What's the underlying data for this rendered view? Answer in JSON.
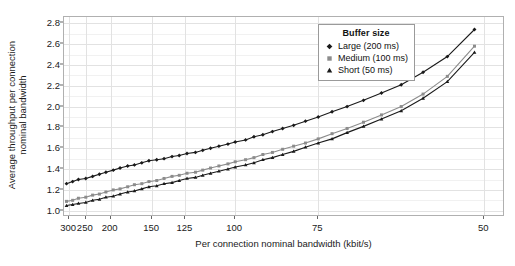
{
  "chart_data": {
    "type": "line",
    "title": "",
    "xlabel": "Per connection nominal bandwidth (kbit/s)",
    "ylabel": "Average throughput per connection\nnominal bandwidth",
    "ylabel_line1": "Average throughput per connection",
    "ylabel_line2": "nominal bandwidth",
    "x_scale": "reciprocal",
    "x_tick_labels": [
      "300",
      "250",
      "200",
      "150",
      "125",
      "100",
      "75",
      "50"
    ],
    "x_ticks": [
      300,
      250,
      200,
      150,
      125,
      100,
      75,
      50
    ],
    "xlim": [
      320,
      48
    ],
    "y_tick_labels": [
      "1.0",
      "1.2",
      "1.4",
      "1.6",
      "1.8",
      "2.0",
      "2.2",
      "2.4",
      "2.6",
      "2.8"
    ],
    "y_ticks": [
      1.0,
      1.2,
      1.4,
      1.6,
      1.8,
      2.0,
      2.2,
      2.4,
      2.6,
      2.8
    ],
    "ylim": [
      0.94,
      2.86
    ],
    "grid": true,
    "legend_position": "top-right",
    "legend_title": "Buffer size",
    "x": [
      310,
      288,
      270,
      250,
      234,
      220,
      208,
      196,
      186,
      176,
      168,
      160,
      153,
      146,
      140,
      134,
      129,
      124,
      119,
      115,
      111,
      107,
      103,
      100,
      96,
      93,
      90,
      87,
      84,
      81,
      78,
      75,
      72,
      69,
      66,
      63,
      60,
      57,
      54,
      51
    ],
    "series": [
      {
        "name": "Large (200 ms)",
        "marker": "diamond",
        "color": "#1a1a1a",
        "values": [
          1.26,
          1.28,
          1.3,
          1.31,
          1.33,
          1.35,
          1.37,
          1.39,
          1.41,
          1.43,
          1.44,
          1.46,
          1.48,
          1.49,
          1.5,
          1.52,
          1.53,
          1.55,
          1.56,
          1.58,
          1.6,
          1.62,
          1.64,
          1.66,
          1.68,
          1.71,
          1.73,
          1.76,
          1.79,
          1.82,
          1.86,
          1.9,
          1.95,
          2.0,
          2.06,
          2.13,
          2.21,
          2.33,
          2.48,
          2.74
        ]
      },
      {
        "name": "Medium (100 ms)",
        "marker": "square",
        "color": "#8c8c8c",
        "values": [
          1.09,
          1.1,
          1.12,
          1.13,
          1.15,
          1.16,
          1.18,
          1.2,
          1.21,
          1.23,
          1.25,
          1.26,
          1.28,
          1.29,
          1.31,
          1.33,
          1.34,
          1.36,
          1.37,
          1.39,
          1.41,
          1.43,
          1.45,
          1.47,
          1.49,
          1.51,
          1.54,
          1.56,
          1.59,
          1.62,
          1.65,
          1.69,
          1.74,
          1.79,
          1.85,
          1.92,
          2.0,
          2.12,
          2.29,
          2.58
        ]
      },
      {
        "name": "Short (50 ms)",
        "marker": "triangle",
        "color": "#1a1a1a",
        "values": [
          1.05,
          1.06,
          1.07,
          1.08,
          1.1,
          1.11,
          1.13,
          1.14,
          1.16,
          1.18,
          1.19,
          1.21,
          1.23,
          1.24,
          1.26,
          1.27,
          1.29,
          1.31,
          1.32,
          1.34,
          1.36,
          1.38,
          1.4,
          1.42,
          1.44,
          1.46,
          1.49,
          1.51,
          1.54,
          1.57,
          1.61,
          1.65,
          1.69,
          1.75,
          1.81,
          1.88,
          1.96,
          2.08,
          2.24,
          2.52
        ]
      }
    ]
  },
  "legend": {
    "title": "Buffer size",
    "items": [
      {
        "label": "Large (200 ms)"
      },
      {
        "label": "Medium (100 ms)"
      },
      {
        "label": "Short (50 ms)"
      }
    ]
  },
  "colors": {
    "dark": "#1a1a1a",
    "gray": "#8c8c8c",
    "grid": "#e2e2e2",
    "panel_border": "#b0b0b0",
    "background": "#ffffff"
  }
}
